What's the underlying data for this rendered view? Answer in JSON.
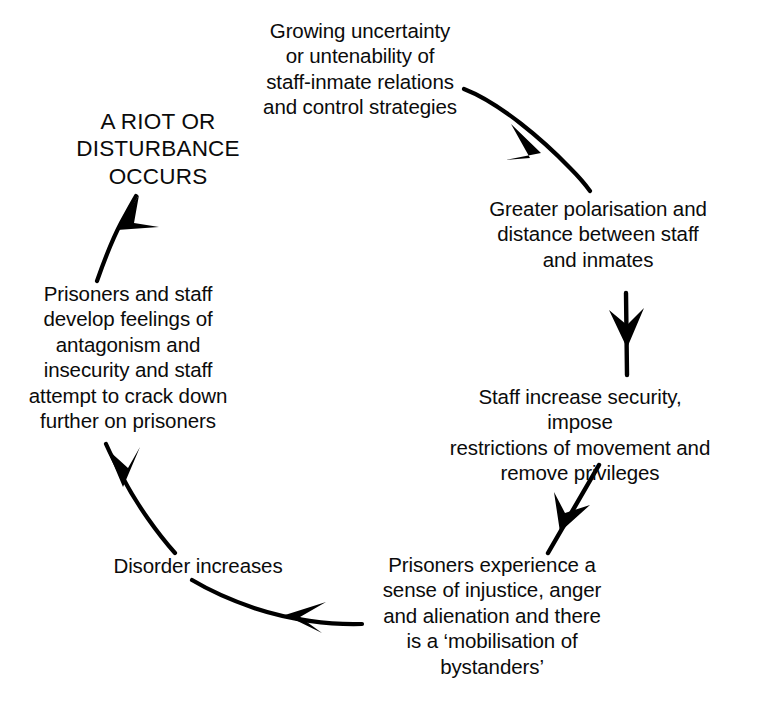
{
  "diagram": {
    "type": "cycle",
    "title": "",
    "direction": "clockwise",
    "background_color": "#ffffff",
    "text_color": "#0b0b0b",
    "arrow_color": "#000000",
    "nodes": [
      {
        "id": "uncertainty",
        "order": 1,
        "label": "Growing uncertainty\nor untenability of\nstaff-inmate relations\nand control strategies",
        "emphasis": false
      },
      {
        "id": "polarisation",
        "order": 2,
        "label": "Greater polarisation and\ndistance between staff\nand inmates",
        "emphasis": false
      },
      {
        "id": "security",
        "order": 3,
        "label": "Staff increase security, impose\nrestrictions of movement and\nremove privileges",
        "emphasis": false
      },
      {
        "id": "injustice",
        "order": 4,
        "label": "Prisoners experience a\nsense of injustice, anger\nand alienation and there\nis a ‘mobilisation of\nbystanders’",
        "emphasis": false
      },
      {
        "id": "disorder",
        "order": 5,
        "label": "Disorder increases",
        "emphasis": false
      },
      {
        "id": "antagonism",
        "order": 6,
        "label": "Prisoners and staff\ndevelop feelings of\nantagonism and\ninsecurity and staff\nattempt to crack down\nfurther on prisoners",
        "emphasis": false
      },
      {
        "id": "riot",
        "order": 7,
        "label": "A RIOT OR\nDISTURBANCE\nOCCURS",
        "emphasis": true
      }
    ],
    "connectors": [
      {
        "id": "arrow-uncertainty-to-polarisation",
        "from": "uncertainty",
        "to": "polarisation",
        "shape": "curve-down-right"
      },
      {
        "id": "arrow-polarisation-to-security",
        "from": "polarisation",
        "to": "security",
        "shape": "straight-down"
      },
      {
        "id": "arrow-security-to-injustice",
        "from": "security",
        "to": "injustice",
        "shape": "diagonal-down-left"
      },
      {
        "id": "arrow-injustice-to-disorder",
        "from": "injustice",
        "to": "disorder",
        "shape": "curve-left"
      },
      {
        "id": "arrow-disorder-to-antagonism",
        "from": "disorder",
        "to": "antagonism",
        "shape": "curve-up-left"
      },
      {
        "id": "arrow-antagonism-to-riot",
        "from": "antagonism",
        "to": "riot",
        "shape": "curve-up-right"
      }
    ]
  }
}
